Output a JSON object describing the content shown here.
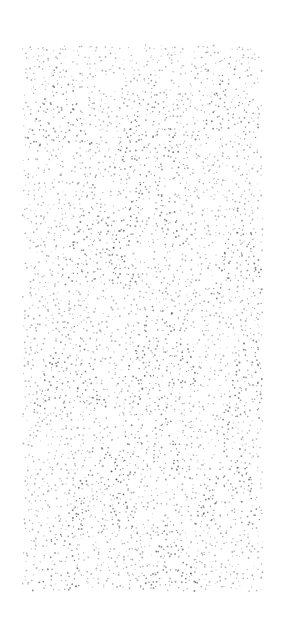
{
  "artwork": {
    "type": "stipple-pattern",
    "description": "Stippled dot texture forming overlapping triangular peaks and scalloped arcs",
    "background_color": "#ffffff",
    "dot_color": "#3a3a3a",
    "panel": {
      "x": 25,
      "y": 47,
      "width": 237,
      "height": 545
    },
    "peaks": [
      {
        "cx": 60,
        "cy": 100,
        "h": 90,
        "w": 70
      },
      {
        "cx": 150,
        "cy": 120,
        "h": 100,
        "w": 80
      },
      {
        "cx": 230,
        "cy": 95,
        "h": 90,
        "w": 70
      },
      {
        "cx": 95,
        "cy": 230,
        "h": 110,
        "w": 85
      },
      {
        "cx": 150,
        "cy": 200,
        "h": 100,
        "w": 80
      },
      {
        "cx": 240,
        "cy": 250,
        "h": 110,
        "w": 70
      },
      {
        "cx": 70,
        "cy": 360,
        "h": 100,
        "w": 80
      },
      {
        "cx": 160,
        "cy": 330,
        "h": 110,
        "w": 85
      },
      {
        "cx": 250,
        "cy": 370,
        "h": 100,
        "w": 60
      },
      {
        "cx": 100,
        "cy": 480,
        "h": 110,
        "w": 80
      },
      {
        "cx": 150,
        "cy": 420,
        "h": 120,
        "w": 85
      },
      {
        "cx": 230,
        "cy": 470,
        "h": 110,
        "w": 75
      },
      {
        "cx": 60,
        "cy": 560,
        "h": 90,
        "w": 70
      },
      {
        "cx": 170,
        "cy": 560,
        "h": 100,
        "w": 80
      }
    ],
    "density": 0.42,
    "seed": 7
  }
}
